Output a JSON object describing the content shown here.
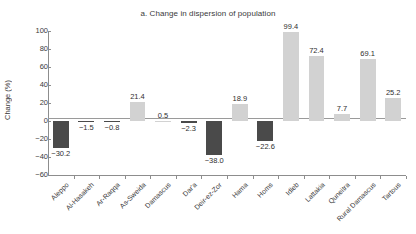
{
  "chart_data": {
    "type": "bar",
    "title": "a. Change in dispersion of population",
    "xlabel": "",
    "ylabel": "Change (%)",
    "ylim": [
      -60,
      100
    ],
    "yticks": [
      100,
      80,
      60,
      40,
      20,
      0,
      -20,
      -40,
      -60
    ],
    "ytick_labels": [
      "100",
      "80",
      "60",
      "40",
      "20",
      "0",
      "−20",
      "−40",
      "−60"
    ],
    "grid": false,
    "legend": "none",
    "categories": [
      "Aleppo",
      "Al-Hasakeh",
      "Ar-Raqqa",
      "As-Sweida",
      "Damascus",
      "Dar'a",
      "Deir-ez-Zor",
      "Hama",
      "Homs",
      "Idleb",
      "Lattakia",
      "Quneitra",
      "Rural Damascus",
      "Tartous"
    ],
    "values": [
      -30.2,
      -1.5,
      -0.8,
      21.4,
      0.5,
      -2.3,
      -38.0,
      18.9,
      -22.6,
      99.4,
      72.4,
      7.7,
      69.1,
      25.2
    ],
    "value_labels": [
      "−30.2",
      "−1.5",
      "−0.8",
      "21.4",
      "0.5",
      "−2.3",
      "−38.0",
      "18.9",
      "−22.6",
      "99.4",
      "72.4",
      "7.7",
      "69.1",
      "25.2"
    ],
    "colors": {
      "positive_bar": "#d2d2d2",
      "negative_bar": "#4a4a4a",
      "axis": "#8d8d8d",
      "text": "#2f2f2f",
      "background": "#ffffff"
    }
  }
}
